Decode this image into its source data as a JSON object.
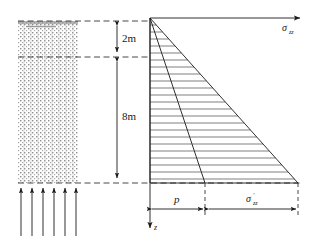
{
  "figure": {
    "type": "engineering-diagram",
    "background_color": "#ffffff",
    "line_color": "#1a1a1a",
    "soil_fill_color": "#9a9a9a"
  },
  "labels": {
    "depth_upper": "2m",
    "depth_lower": "8m",
    "surcharge": "p",
    "stress_axis": "σ",
    "stress_axis_sub": "zz",
    "effective_stress": "σ",
    "effective_stress_sub": "zz",
    "effective_stress_prime": "′",
    "depth_axis": "z"
  },
  "geometry": {
    "soil_block": {
      "x": 18,
      "y": 21,
      "width": 60,
      "height": 162
    },
    "ground_level_y": 21,
    "water_table_y": 57,
    "base_level_y": 183,
    "stress_origin_x": 150,
    "stress_axis_end_x": 300,
    "stress_top_y": 18,
    "surcharge_edge_x": 205,
    "stress_right_x": 298,
    "dimension_line_x": 117,
    "uplift_arrow_count": 6,
    "hatch_line_count": 22
  },
  "annotations": {
    "upper_layer_thickness_m": 2,
    "lower_layer_thickness_m": 8,
    "total_depth_m": 10
  }
}
